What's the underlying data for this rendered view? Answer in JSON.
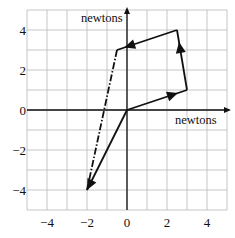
{
  "diagram": {
    "x_axis_label": "newtons",
    "y_axis_label": "newtons",
    "x_range": [
      -5,
      5
    ],
    "y_range": [
      -5,
      5
    ],
    "grid_step": 1,
    "x_ticks": [
      {
        "v": -4,
        "label": "−4"
      },
      {
        "v": -2,
        "label": "−2"
      },
      {
        "v": 0,
        "label": "0"
      },
      {
        "v": 2,
        "label": "2"
      },
      {
        "v": 4,
        "label": "4"
      }
    ],
    "y_ticks": [
      {
        "v": 4,
        "label": "4"
      },
      {
        "v": 2,
        "label": "2"
      },
      {
        "v": 0,
        "label": "0"
      },
      {
        "v": -2,
        "label": "−2"
      },
      {
        "v": -4,
        "label": "−4"
      }
    ],
    "vectors": [
      {
        "name": "vector-a",
        "from": [
          0,
          0
        ],
        "to": [
          3,
          1
        ],
        "style": "solid",
        "arrow_at": 0.85
      },
      {
        "name": "vector-b",
        "from": [
          3,
          1
        ],
        "to": [
          2.5,
          4
        ],
        "style": "solid",
        "arrow_at": 0.8
      },
      {
        "name": "vector-c",
        "from": [
          2.5,
          4
        ],
        "to": [
          -0.5,
          3
        ],
        "style": "solid",
        "arrow_at": 0.88
      },
      {
        "name": "resultant-dashed",
        "from": [
          -0.5,
          3
        ],
        "to": [
          -2,
          -4
        ],
        "style": "dashdot",
        "arrow_at": null
      },
      {
        "name": "resultant-vector",
        "from": [
          0,
          0
        ],
        "to": [
          -2,
          -4
        ],
        "style": "solid",
        "arrow_at": 1.0
      }
    ],
    "colors": {
      "grid": "#b8b8b8",
      "axis": "#111111",
      "vector": "#111111"
    }
  }
}
